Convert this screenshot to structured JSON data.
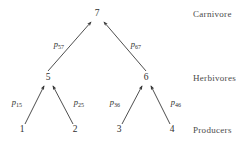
{
  "figure": {
    "background_color": "#ffffff",
    "stroke_color": "#3a3a3a",
    "text_color": "#2e2e2e"
  },
  "tier_labels": [
    {
      "id": "carnivore",
      "text": "Carnivore",
      "x": 193,
      "y": 14
    },
    {
      "id": "herbivores",
      "text": "Herbivores",
      "x": 193,
      "y": 78
    },
    {
      "id": "producers",
      "text": "Producers",
      "x": 193,
      "y": 130
    }
  ],
  "nodes": [
    {
      "id": "n1",
      "label": "1",
      "x": 22,
      "y": 130,
      "tier": "producers"
    },
    {
      "id": "n2",
      "label": "2",
      "x": 75,
      "y": 130,
      "tier": "producers"
    },
    {
      "id": "n3",
      "label": "3",
      "x": 119,
      "y": 130,
      "tier": "producers"
    },
    {
      "id": "n4",
      "label": "4",
      "x": 172,
      "y": 130,
      "tier": "producers"
    },
    {
      "id": "n5",
      "label": "5",
      "x": 48,
      "y": 78,
      "tier": "herbivores"
    },
    {
      "id": "n6",
      "label": "6",
      "x": 146,
      "y": 78,
      "tier": "herbivores"
    },
    {
      "id": "n7",
      "label": "7",
      "x": 97,
      "y": 14,
      "tier": "carnivore"
    }
  ],
  "edges": [
    {
      "id": "e15",
      "from": "n1",
      "to": "n5",
      "x1": 25,
      "y1": 124,
      "x2": 44,
      "y2": 86,
      "label": "p",
      "sub": "15",
      "lx": 17,
      "ly": 103
    },
    {
      "id": "e25",
      "from": "n2",
      "to": "n5",
      "x1": 73,
      "y1": 124,
      "x2": 53,
      "y2": 86,
      "label": "p",
      "sub": "25",
      "lx": 79,
      "ly": 103
    },
    {
      "id": "e36",
      "from": "n3",
      "to": "n6",
      "x1": 122,
      "y1": 124,
      "x2": 142,
      "y2": 86,
      "label": "p",
      "sub": "36",
      "lx": 115,
      "ly": 103
    },
    {
      "id": "e46",
      "from": "n4",
      "to": "n6",
      "x1": 170,
      "y1": 124,
      "x2": 151,
      "y2": 86,
      "label": "p",
      "sub": "46",
      "lx": 176,
      "ly": 103
    },
    {
      "id": "e57",
      "from": "n5",
      "to": "n7",
      "x1": 48,
      "y1": 71,
      "x2": 91,
      "y2": 22,
      "label": "p",
      "sub": "57",
      "lx": 59,
      "ly": 45
    },
    {
      "id": "e67",
      "from": "n6",
      "to": "n7",
      "x1": 146,
      "y1": 71,
      "x2": 104,
      "y2": 22,
      "label": "p",
      "sub": "67",
      "lx": 136,
      "ly": 45
    }
  ]
}
